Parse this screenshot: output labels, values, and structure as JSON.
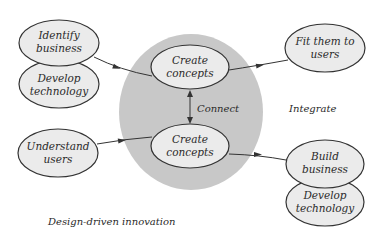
{
  "diagram": {
    "type": "concept-diagram",
    "colors": {
      "background": "#ffffff",
      "node_fill": "#ebebeb",
      "node_stroke": "#333333",
      "hub_circle": "#c8c8c8",
      "text": "#2a2a2a"
    },
    "nodes": {
      "identify_business": {
        "line1": "Identify",
        "line2": "business"
      },
      "develop_technology_left": {
        "line1": "Develop",
        "line2": "technology"
      },
      "create_concepts_top": {
        "line1": "Create",
        "line2": "concepts"
      },
      "create_concepts_bottom": {
        "line1": "Create",
        "line2": "concepts"
      },
      "fit_them_to_users": {
        "line1": "Fit them to",
        "line2": "users"
      },
      "understand_users": {
        "line1": "Understand",
        "line2": "users"
      },
      "build_business": {
        "line1": "Build",
        "line2": "business"
      },
      "develop_technology_right": {
        "line1": "Develop",
        "line2": "technology"
      }
    },
    "labels": {
      "connect": "Connect",
      "integrate": "Integrate",
      "caption": "Design-driven innovation"
    },
    "edges": [
      {
        "from": "identify_business",
        "to": "create_concepts_top"
      },
      {
        "from": "create_concepts_top",
        "to": "fit_them_to_users"
      },
      {
        "from": "create_concepts_top",
        "to": "create_concepts_bottom",
        "bidirectional": true,
        "label": "Connect"
      },
      {
        "from": "understand_users",
        "to": "create_concepts_bottom"
      },
      {
        "from": "create_concepts_bottom",
        "to": "build_business"
      }
    ]
  }
}
